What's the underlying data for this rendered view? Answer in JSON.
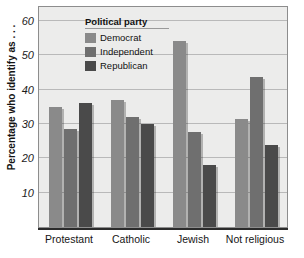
{
  "chart_data": {
    "type": "bar",
    "title": "",
    "xlabel": "",
    "ylabel": "Percentage who identify as . . .",
    "ylim": [
      0,
      64
    ],
    "yticks": [
      10,
      20,
      30,
      40,
      50,
      60
    ],
    "grid": true,
    "legend_title": "Political party",
    "legend_position": "top-left-inside",
    "categories": [
      "Protestant",
      "Catholic",
      "Jewish",
      "Not religious"
    ],
    "series": [
      {
        "name": "Democrat",
        "color": "#8a8a8a",
        "values": [
          35,
          37,
          54,
          31.5
        ]
      },
      {
        "name": "Independent",
        "color": "#6f6f6f",
        "values": [
          28.5,
          32,
          27.5,
          43.5
        ]
      },
      {
        "name": "Republican",
        "color": "#4a4a4a",
        "values": [
          36,
          30,
          18,
          24
        ]
      }
    ]
  },
  "axis": {
    "y_tick_labels": [
      "10",
      "20",
      "30",
      "40",
      "50",
      "60"
    ],
    "y_title": "Percentage who identify as . . ."
  },
  "legend": {
    "title": "Political party",
    "items": [
      {
        "label": "Democrat"
      },
      {
        "label": "Independent"
      },
      {
        "label": "Republican"
      }
    ]
  },
  "xaxis": {
    "labels": [
      "Protestant",
      "Catholic",
      "Jewish",
      "Not religious"
    ]
  },
  "style": {
    "plot_background": "#ececeb",
    "grid_color": "#b9b9b9",
    "axis_color": "#2b2b2b",
    "page_background": "#ffffff"
  }
}
